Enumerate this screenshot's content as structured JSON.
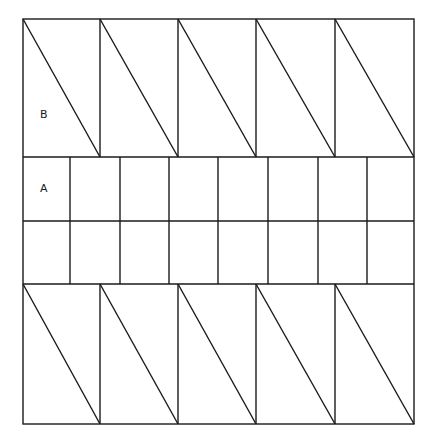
{
  "figure": {
    "stroke_color": "#1a1a1a",
    "background": "#ffffff",
    "outer": {
      "left": 23,
      "top": 19,
      "right": 414,
      "bottom": 424
    },
    "horizontal_lines_y": [
      157,
      221,
      284
    ],
    "top_band": {
      "y1": 19,
      "y2": 157,
      "columns_x": [
        23,
        100,
        178,
        256,
        335,
        414
      ]
    },
    "middle_band": {
      "y1": 157,
      "y2": 284,
      "columns_x": [
        23,
        70,
        120,
        169,
        218,
        268,
        318,
        367,
        414
      ]
    },
    "bottom_band": {
      "y1": 284,
      "y2": 424,
      "columns_x": [
        23,
        100,
        178,
        256,
        335,
        414
      ]
    },
    "labels": [
      {
        "text": "B",
        "x": 44,
        "y": 122
      },
      {
        "text": "A",
        "x": 44,
        "y": 198
      }
    ]
  }
}
